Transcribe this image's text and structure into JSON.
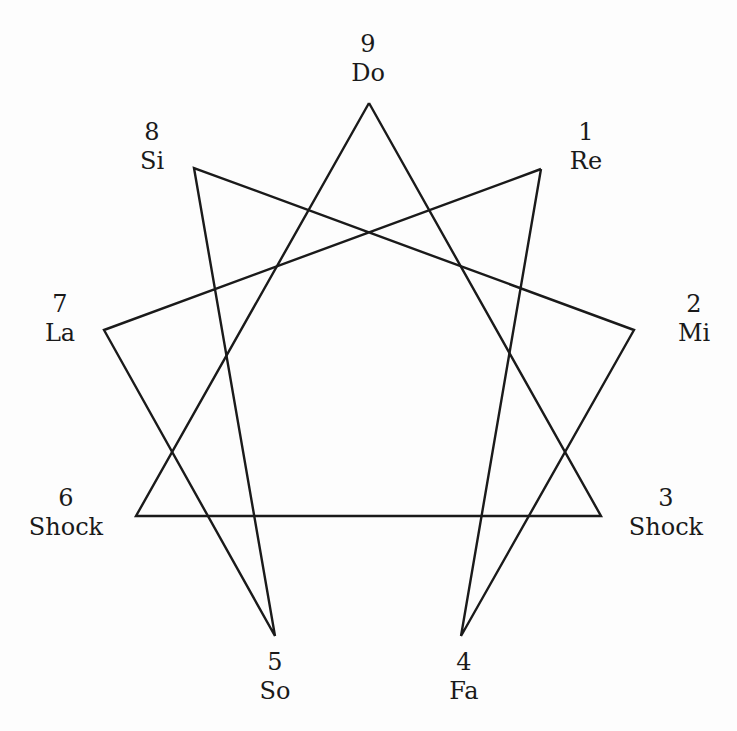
{
  "diagram": {
    "type": "enneagram",
    "stroke_color": "#1a1a1a",
    "background": "#fdfdfd",
    "points": [
      {
        "id": "9",
        "number": "9",
        "name": "Do",
        "x": 369,
        "y": 103,
        "label_x": 368,
        "label_y": 30
      },
      {
        "id": "1",
        "number": "1",
        "name": "Re",
        "x": 541,
        "y": 169,
        "label_x": 586,
        "label_y": 118
      },
      {
        "id": "2",
        "number": "2",
        "name": "Mi",
        "x": 634,
        "y": 330,
        "label_x": 694,
        "label_y": 290
      },
      {
        "id": "3",
        "number": "3",
        "name": "Shock",
        "x": 601,
        "y": 516,
        "label_x": 666,
        "label_y": 484
      },
      {
        "id": "4",
        "number": "4",
        "name": "Fa",
        "x": 461,
        "y": 636,
        "label_x": 464,
        "label_y": 648
      },
      {
        "id": "5",
        "number": "5",
        "name": "So",
        "x": 275,
        "y": 636,
        "label_x": 275,
        "label_y": 648
      },
      {
        "id": "6",
        "number": "6",
        "name": "Shock",
        "x": 136,
        "y": 516,
        "label_x": 66,
        "label_y": 484
      },
      {
        "id": "7",
        "number": "7",
        "name": "La",
        "x": 104,
        "y": 330,
        "label_x": 60,
        "label_y": 290
      },
      {
        "id": "8",
        "number": "8",
        "name": "Si",
        "x": 194,
        "y": 168,
        "label_x": 152,
        "label_y": 118
      }
    ],
    "triangle_path": [
      "9",
      "3",
      "6",
      "9"
    ],
    "hexad_path": [
      "1",
      "4",
      "2",
      "8",
      "5",
      "7",
      "1"
    ]
  }
}
